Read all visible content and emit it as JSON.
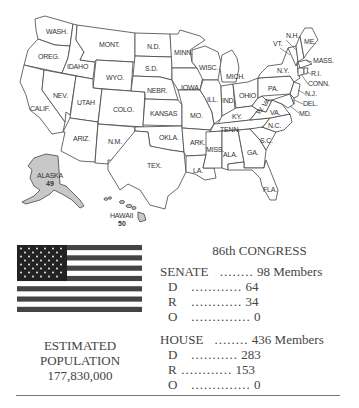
{
  "map": {
    "states": [
      "WASH.",
      "OREG.",
      "CALIF.",
      "IDAHO",
      "NEV.",
      "MONT.",
      "WYO.",
      "UTAH",
      "ARIZ.",
      "COLO.",
      "N.M.",
      "N.D.",
      "S.D.",
      "NEBR.",
      "KANSAS",
      "OKLA.",
      "TEX.",
      "MINN.",
      "IOWA",
      "MO.",
      "ARK.",
      "LA.",
      "WISC.",
      "ILL.",
      "MICH.",
      "IND.",
      "OHIO",
      "KY.",
      "TENN.",
      "MISS.",
      "ALA.",
      "GA.",
      "FLA.",
      "S.C.",
      "N.C.",
      "VA.",
      "W. VA.",
      "PA.",
      "N.Y.",
      "VT.",
      "N.H.",
      "ME.",
      "MASS.",
      "R.I.",
      "CONN.",
      "N.J.",
      "DEL.",
      "MD."
    ],
    "alaska": {
      "name": "ALASKA",
      "number": "49"
    },
    "hawaii": {
      "name": "HAWAII",
      "number": "50"
    }
  },
  "population": {
    "label_line1": "ESTIMATED",
    "label_line2": "POPULATION",
    "value": "177,830,000"
  },
  "congress": {
    "title": "86th CONGRESS",
    "senate": {
      "label": "SENATE",
      "dots": "........",
      "total": "98 Members",
      "rows": [
        {
          "party": "D",
          "dots": "............",
          "value": "64"
        },
        {
          "party": "R",
          "dots": "............",
          "value": "34"
        },
        {
          "party": "O",
          "dots": "..............",
          "value": "0"
        }
      ]
    },
    "house": {
      "label": "HOUSE",
      "dots": "........",
      "total": "436 Members",
      "rows": [
        {
          "party": "D",
          "dots": "...........",
          "value": "283"
        },
        {
          "party": "R",
          "dots": "............",
          "value": "153"
        },
        {
          "party": "O",
          "dots": "..............",
          "value": "0"
        }
      ]
    }
  }
}
